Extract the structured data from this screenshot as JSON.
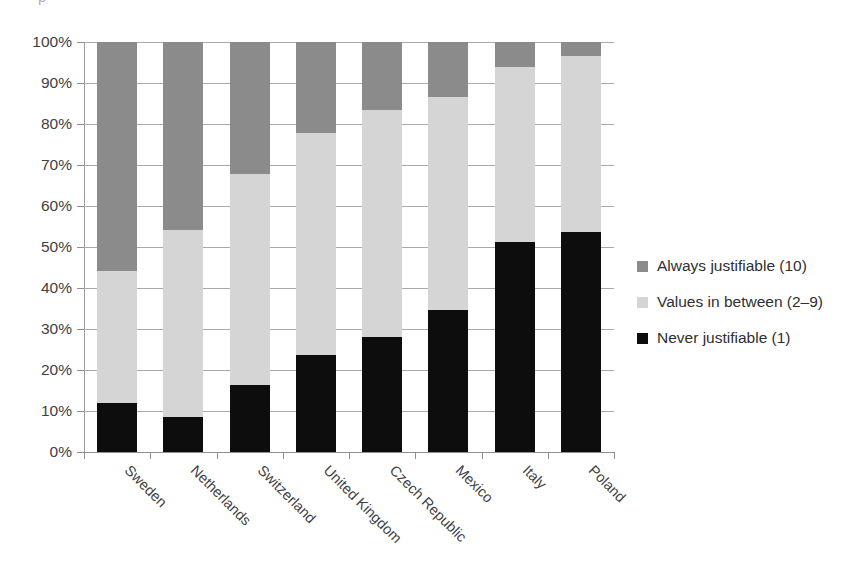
{
  "title_fragment": "p",
  "chart_data": {
    "type": "bar",
    "subtype": "stacked-100-percent-column",
    "title": "",
    "xlabel": "",
    "ylabel": "",
    "ylim": [
      0,
      100
    ],
    "ytick_labels": [
      "100%",
      "90%",
      "80%",
      "70%",
      "60%",
      "50%",
      "40%",
      "30%",
      "20%",
      "10%",
      "0%"
    ],
    "ytick_values": [
      100,
      90,
      80,
      70,
      60,
      50,
      40,
      30,
      20,
      10,
      0
    ],
    "grid": true,
    "grid_axis": "y",
    "legend_position": "right",
    "categories": [
      "Sweden",
      "Netherlands",
      "Switzerland",
      "United Kingdom",
      "Czech Republic",
      "Mexico",
      "Italy",
      "Poland"
    ],
    "series": [
      {
        "name": "Never justifiable (1)",
        "color": "#0d0d0d",
        "values": [
          11.9,
          8.6,
          16.4,
          23.6,
          28.0,
          34.6,
          51.2,
          53.7
        ]
      },
      {
        "name": "Values in between (2–9)",
        "color": "#d5d5d5",
        "values": [
          32.3,
          45.5,
          51.3,
          54.1,
          55.4,
          51.9,
          42.7,
          43.0
        ]
      },
      {
        "name": "Always justifiable (10)",
        "color": "#8b8b8b",
        "values": [
          55.8,
          45.9,
          32.3,
          22.3,
          16.6,
          13.5,
          6.1,
          3.3
        ]
      }
    ],
    "cumulative_tops": {
      "never": [
        11.9,
        8.6,
        16.4,
        23.6,
        28.0,
        34.6,
        51.2,
        53.7
      ],
      "never_plus_mid": [
        44.2,
        54.1,
        67.7,
        77.7,
        83.4,
        86.5,
        93.9,
        96.7
      ],
      "total": [
        100,
        100,
        100,
        100,
        100,
        100,
        100,
        100
      ]
    }
  },
  "legend": {
    "items": [
      {
        "label": "Always justifiable (10)",
        "color": "#8b8b8b",
        "swatch_name": "legend-swatch-always"
      },
      {
        "label": "Values in between (2–9)",
        "color": "#d5d5d5",
        "swatch_name": "legend-swatch-between"
      },
      {
        "label": "Never justifiable (1)",
        "color": "#0d0d0d",
        "swatch_name": "legend-swatch-never"
      }
    ]
  }
}
